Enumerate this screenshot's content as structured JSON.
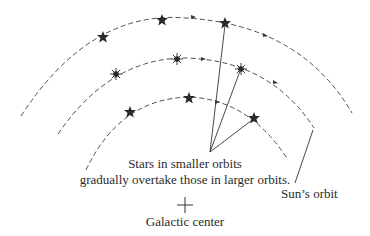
{
  "diagram": {
    "center": {
      "x": 185,
      "y": 205
    },
    "orbits": [
      {
        "name": "outer",
        "radius": 182,
        "start": {
          "x": 21,
          "y": 116
        },
        "end": {
          "x": 352,
          "y": 113
        },
        "stars": [
          {
            "x": 103,
            "y": 37,
            "type": "star"
          },
          {
            "x": 162,
            "y": 20,
            "type": "star"
          },
          {
            "x": 225,
            "y": 23,
            "type": "star"
          }
        ]
      },
      {
        "name": "middle",
        "radius": 146,
        "start": {
          "x": 58,
          "y": 134
        },
        "end": {
          "x": 314,
          "y": 128
        },
        "stars": [
          {
            "x": 116,
            "y": 74,
            "type": "burst"
          },
          {
            "x": 177,
            "y": 59,
            "type": "burst"
          },
          {
            "x": 241,
            "y": 69,
            "type": "burst"
          }
        ]
      },
      {
        "name": "inner",
        "radius": 107,
        "start": {
          "x": 86,
          "y": 170
        },
        "end": {
          "x": 288,
          "y": 133
        },
        "stars": [
          {
            "x": 130,
            "y": 112,
            "type": "star"
          },
          {
            "x": 189,
            "y": 98,
            "type": "star"
          },
          {
            "x": 254,
            "y": 118,
            "type": "star"
          }
        ]
      }
    ],
    "pointer_origin": {
      "x": 210,
      "y": 152
    },
    "sun_pointer": {
      "from": {
        "x": 313,
        "y": 130
      },
      "to": {
        "x": 295,
        "y": 183
      }
    },
    "labels": {
      "caption_line1": "Stars in smaller orbits",
      "caption_line2": "gradually overtake those in larger orbits.",
      "sun_orbit": "Sun’s orbit",
      "center_mark": "+",
      "galactic_center": "Galactic center"
    },
    "colors": {
      "line": "#3a3a3a",
      "star": "#2a2a2a",
      "background": "#ffffff"
    }
  }
}
